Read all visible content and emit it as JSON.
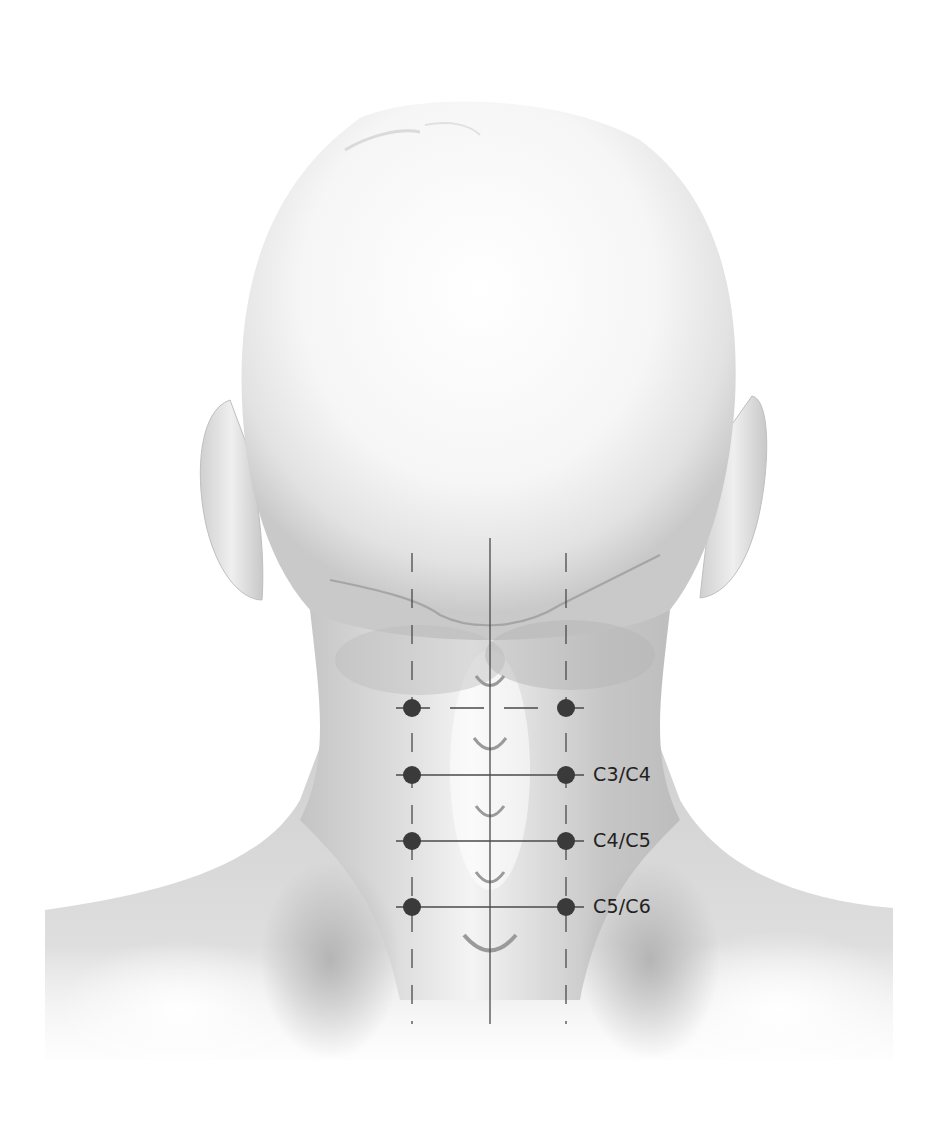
{
  "figure": {
    "background_color": "#ffffff",
    "skin_light": "#f7f7f7",
    "skin_mid": "#d9d9d9",
    "skin_dark": "#b8b8b8",
    "marker_color": "#3a3a3a",
    "line_color": "#4a4a4a",
    "label_color": "#222222"
  },
  "guides": {
    "midline_x": 490,
    "left_paraspinal_x": 412,
    "right_paraspinal_x": 566,
    "top_y": 538,
    "bottom_y": 1024
  },
  "levels": [
    {
      "id": "unlabeled-top",
      "label": "",
      "y": 708
    },
    {
      "id": "c3-c4",
      "label": "C3/C4",
      "y": 775
    },
    {
      "id": "c4-c5",
      "label": "C4/C5",
      "y": 841
    },
    {
      "id": "c5-c6",
      "label": "C5/C6",
      "y": 907
    }
  ],
  "spinous_processes_y": [
    683,
    745,
    813,
    880,
    945
  ],
  "labels": {
    "level_1": "C3/C4",
    "level_2": "C4/C5",
    "level_3": "C5/C6"
  }
}
